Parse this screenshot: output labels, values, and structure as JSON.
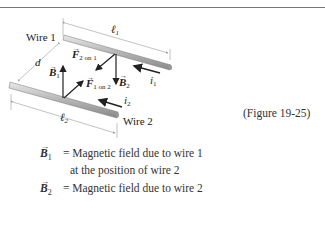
{
  "figure": {
    "labels": {
      "wire1": "Wire 1",
      "wire2": "Wire 2",
      "l1": "ℓ",
      "l1_sub": "1",
      "l2": "ℓ",
      "l2_sub": "2",
      "d": "d",
      "B1": "B",
      "B1_sub": "1",
      "B2": "B",
      "B2_sub": "2",
      "F2on1": "F",
      "F2on1_sub": "2 on 1",
      "F1on2": "F",
      "F1on2_sub": "1 on 2",
      "i1": "i",
      "i1_sub": "1",
      "i2": "i",
      "i2_sub": "2"
    },
    "caption": "(Figure 19-25)"
  },
  "legend": [
    {
      "symbol": "B",
      "sub": "1",
      "eq": "= Magnetic field due to wire 1",
      "cont": "at the position of wire 2"
    },
    {
      "symbol": "B",
      "sub": "2",
      "eq": "= Magnetic field due to wire 2",
      "cont": ""
    }
  ]
}
